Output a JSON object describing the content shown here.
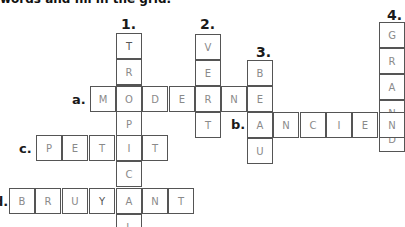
{
  "instruction": "words and fill in the grid.",
  "down_clues": [
    {
      "number": "1.",
      "answer": "TROPICAL"
    },
    {
      "number": "2.",
      "answer": "VERT"
    },
    {
      "number": "3.",
      "answer": "BEAU"
    },
    {
      "number": "4.",
      "answer": "GRAND"
    }
  ],
  "across_clues": [
    {
      "label": "a.",
      "answer": "MODERNE"
    },
    {
      "label": "b.",
      "answer": "ANCIEN"
    },
    {
      "label": "c.",
      "answer": "PETIT"
    },
    {
      "label": "d.",
      "answer": "BRUYANT"
    }
  ],
  "grid": {
    "col1": [
      "T",
      "R",
      "O",
      "P",
      "I",
      "C",
      "A",
      "L"
    ],
    "col2": [
      "V",
      "E",
      "R",
      "T"
    ],
    "col3": [
      "B",
      "E",
      "A",
      "U"
    ],
    "col4": [
      "G",
      "R",
      "A",
      "N",
      "D"
    ],
    "row_a": [
      "M",
      "O",
      "D",
      "E",
      "R",
      "N",
      "E"
    ],
    "row_b": [
      "A",
      "N",
      "C",
      "I",
      "E",
      "N"
    ],
    "row_c": [
      "P",
      "E",
      "T",
      "I",
      "T"
    ],
    "row_d": [
      "B",
      "R",
      "U",
      "Y",
      "A",
      "N",
      "T"
    ]
  }
}
